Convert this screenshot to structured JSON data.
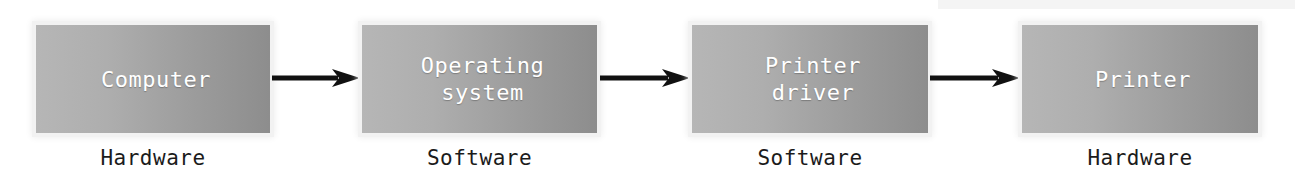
{
  "diagram": {
    "type": "flow-chain",
    "orientation": "left-to-right",
    "background_color": "#ffffff",
    "node_gradient": {
      "from": "#b6b6b6",
      "to": "#8d8d8d"
    },
    "node_text_color": "#ffffff",
    "caption_text_color": "#1b1b1b",
    "arrow_color": "#111111",
    "nodes": [
      {
        "id": "computer",
        "label": "Computer",
        "caption": "Hardware",
        "x": 36,
        "y": 25,
        "width": 234,
        "height": 108,
        "caption_x": 36,
        "caption_y": 146
      },
      {
        "id": "operating-system",
        "label": "Operating\nsystem",
        "caption": "Software",
        "x": 362,
        "y": 25,
        "width": 235,
        "height": 108,
        "caption_x": 362,
        "caption_y": 146
      },
      {
        "id": "printer-driver",
        "label": "Printer\ndriver",
        "caption": "Software",
        "x": 692,
        "y": 25,
        "width": 236,
        "height": 108,
        "caption_x": 692,
        "caption_y": 146
      },
      {
        "id": "printer",
        "label": "Printer",
        "caption": "Hardware",
        "x": 1022,
        "y": 25,
        "width": 236,
        "height": 108,
        "caption_x": 1022,
        "caption_y": 146
      }
    ],
    "arrows": [
      {
        "id": "arrow-computer-to-os",
        "from": "computer",
        "to": "operating-system",
        "x": 272,
        "y": 69,
        "width": 88
      },
      {
        "id": "arrow-os-to-driver",
        "from": "operating-system",
        "to": "printer-driver",
        "x": 600,
        "y": 69,
        "width": 90
      },
      {
        "id": "arrow-driver-to-printer",
        "from": "printer-driver",
        "to": "printer",
        "x": 930,
        "y": 69,
        "width": 90
      }
    ]
  }
}
